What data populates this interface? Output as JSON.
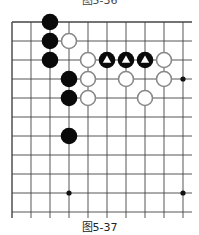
{
  "figure": {
    "top_caption_cropped": "图5-36",
    "caption": "图5-37"
  },
  "board": {
    "origin": {
      "x": 12,
      "y": 22
    },
    "spacing": 19,
    "cols": 10,
    "rows": 11,
    "edges": {
      "left": true,
      "top": true,
      "right": false,
      "bottom": false
    },
    "line_color": "#444444",
    "star_points": [
      [
        9,
        3
      ],
      [
        3,
        9
      ],
      [
        9,
        9
      ]
    ],
    "stones": {
      "black": [
        [
          2,
          0
        ],
        [
          2,
          1
        ],
        [
          2,
          2
        ],
        [
          3,
          3
        ],
        [
          3,
          4
        ],
        [
          3,
          6
        ]
      ],
      "white": [
        [
          3,
          1
        ],
        [
          4,
          2
        ],
        [
          8,
          2
        ],
        [
          4,
          3
        ],
        [
          6,
          3
        ],
        [
          8,
          3
        ],
        [
          4,
          4
        ],
        [
          7,
          4
        ]
      ],
      "black_marked_triangle": [
        [
          5,
          2
        ],
        [
          6,
          2
        ],
        [
          7,
          2
        ]
      ]
    },
    "colors": {
      "black": "#0a0a0a",
      "white_fill": "#ffffff",
      "white_stroke": "#888888",
      "marker": "#ffffff"
    }
  }
}
